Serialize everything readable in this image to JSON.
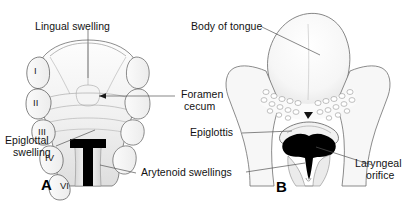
{
  "figure": {
    "background_color": "#ffffff",
    "ink_color": "#1a1a1a",
    "leader_color": "#3a3a3a",
    "dark_fill": "#000000"
  },
  "panels": [
    {
      "id": "A",
      "letter": "A",
      "caption": "Early stage tongue primordia with pharyngeal arches",
      "arch_numerals": [
        "I",
        "II",
        "III",
        "IV",
        "VI"
      ]
    },
    {
      "id": "B",
      "letter": "B",
      "caption": "Later stage tongue with laryngeal inlet"
    }
  ],
  "labels": {
    "lingual_swelling": "Lingual swelling",
    "body_of_tongue": "Body of tongue",
    "foramen_cecum_line1": "Foramen",
    "foramen_cecum_line2": "cecum",
    "epiglottal_swelling_line1": "Epiglottal",
    "epiglottal_swelling_line2": "swelling",
    "epiglottis": "Epiglottis",
    "arytenoid_swellings": "Arytenoid swellings",
    "laryngeal_orifice_line1": "Laryngeal",
    "laryngeal_orifice_line2": "orifice"
  },
  "arch_numerals": {
    "one": "I",
    "two": "II",
    "three": "III",
    "four": "IV",
    "six": "VI"
  },
  "panel_letters": {
    "a": "A",
    "b": "B"
  }
}
